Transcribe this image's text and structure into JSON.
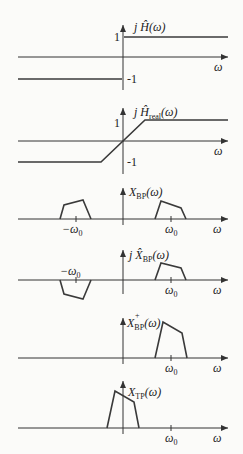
{
  "panels": [
    {
      "name": "hilbert-transfer",
      "label": "j Ĥ(ω)",
      "x_label": "ω",
      "tick_pos": "1",
      "tick_neg": "-1"
    },
    {
      "name": "realizable-hilbert-transfer",
      "label": "j Ĥ",
      "label_sub": "real",
      "label_tail": "(ω)",
      "x_label": "ω",
      "tick_pos": "1",
      "tick_neg": "-1"
    },
    {
      "name": "bandpass-spectrum",
      "label": "X",
      "label_sub": "BP",
      "label_tail": "(ω)",
      "x_label": "ω",
      "tick_left": "−ω",
      "tick_left_sub": "0",
      "tick_right": "ω",
      "tick_right_sub": "0"
    },
    {
      "name": "hilbert-bandpass-spectrum",
      "label": "j X̂",
      "label_sub": "BP",
      "label_tail": "(ω)",
      "x_label": "ω",
      "tick_left": "−ω",
      "tick_left_sub": "0",
      "tick_right": "ω",
      "tick_right_sub": "0"
    },
    {
      "name": "analytic-bandpass-spectrum",
      "label": "X",
      "label_sup": "+",
      "label_sub": "BP",
      "label_tail": "(ω)",
      "x_label": "ω",
      "tick_right": "ω",
      "tick_right_sub": "0"
    },
    {
      "name": "lowpass-equivalent-spectrum",
      "label": "X",
      "label_sub": "TP",
      "label_tail": "(ω)",
      "x_label": "ω",
      "tick_right": "ω",
      "tick_right_sub": "0"
    }
  ]
}
